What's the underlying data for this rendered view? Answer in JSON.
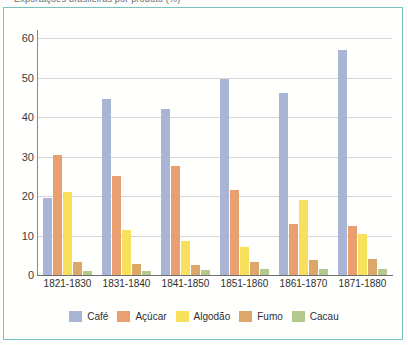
{
  "title_sliver": "Exportações brasileiras por produto (%)",
  "frame": {
    "border_color": "#78c3bf",
    "background": "#fffffd"
  },
  "chart_data": {
    "type": "bar",
    "title": "",
    "xlabel": "",
    "ylabel": "",
    "ylim": [
      0,
      60
    ],
    "yticks": [
      0,
      10,
      20,
      30,
      40,
      50,
      60
    ],
    "grid": true,
    "legend_position": "bottom",
    "categories": [
      "1821-1830",
      "1831-1840",
      "1841-1850",
      "1851-1860",
      "1861-1870",
      "1871-1880"
    ],
    "series": [
      {
        "name": "Café",
        "color": "#aab4d4",
        "values": [
          19.5,
          44.5,
          42.0,
          49.5,
          46.0,
          57.0
        ]
      },
      {
        "name": "Açúcar",
        "color": "#e8a071",
        "values": [
          30.5,
          25.0,
          27.5,
          21.5,
          13.0,
          12.5
        ]
      },
      {
        "name": "Algodão",
        "color": "#f7e05c",
        "values": [
          21.0,
          11.5,
          8.5,
          7.0,
          19.0,
          10.5
        ]
      },
      {
        "name": "Fumo",
        "color": "#dba86a",
        "values": [
          3.3,
          2.8,
          2.6,
          3.2,
          3.7,
          4.0
        ]
      },
      {
        "name": "Cacau",
        "color": "#b3c98e",
        "values": [
          1.0,
          1.0,
          1.3,
          1.5,
          1.5,
          1.6
        ]
      }
    ]
  }
}
